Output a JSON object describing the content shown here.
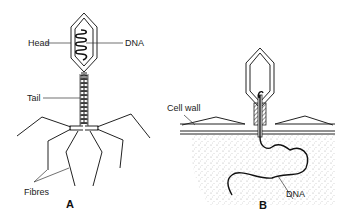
{
  "diagram": {
    "type": "biology-illustration",
    "colors": {
      "ink": "#222222",
      "background": "#ffffff",
      "cytoplasm_dots": "#9a9a9a"
    },
    "panel_a": {
      "label": "A",
      "labels": {
        "head": "Head",
        "dna": "DNA",
        "tail": "Tail",
        "fibres": "Fibres"
      }
    },
    "panel_b": {
      "label": "B",
      "labels": {
        "cell_wall": "Cell wall",
        "dna": "DNA"
      }
    }
  }
}
